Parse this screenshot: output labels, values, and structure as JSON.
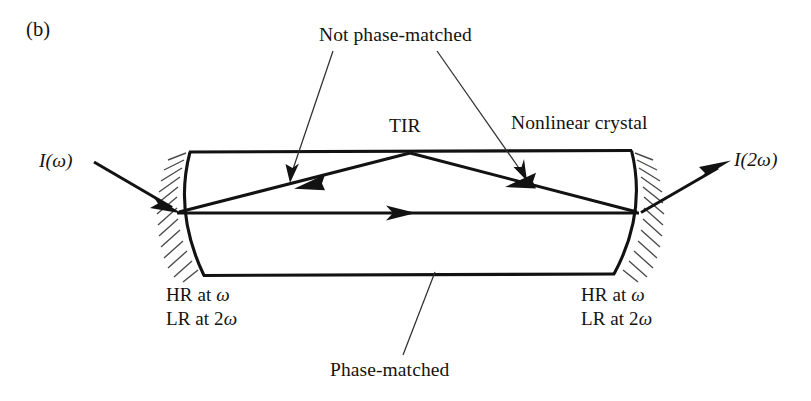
{
  "figure": {
    "panel_letter": "(b)",
    "domain": "Diagram"
  },
  "labels": {
    "not_phase_matched": "Not phase-matched",
    "tir": "TIR",
    "nonlinear_crystal": "Nonlinear crystal",
    "input_beam": "I(ω)",
    "input_beam_prefix": "I(",
    "input_beam_symbol": "ω",
    "input_beam_suffix": ")",
    "output_beam": "I(2ω)",
    "output_beam_prefix": "I(2",
    "output_beam_symbol": "ω",
    "output_beam_suffix": ")",
    "phase_matched": "Phase-matched",
    "coating_hr_prefix": "HR at ",
    "coating_hr_symbol": "ω",
    "coating_lr_prefix": "LR at 2",
    "coating_lr_symbol": "ω",
    "coating_left_line1": "HR at ω",
    "coating_left_line2": "LR at 2ω",
    "coating_right_line1": "HR at ω",
    "coating_right_line2": "LR at 2ω"
  },
  "colors": {
    "ink": "#121212",
    "background": "#ffffff",
    "leader": "#30302e",
    "hatch": "#4a4a48"
  },
  "geometry": {
    "canvas": {
      "width": 811,
      "height": 401
    },
    "crystal": {
      "top_edge": {
        "x1": 190,
        "y1": 152,
        "x2": 631,
        "y2": 151
      },
      "bottom_edge": {
        "x1": 204,
        "y1": 275,
        "x2": 614,
        "y2": 274
      },
      "left_mirror_arc": {
        "top_x": 190,
        "top_y": 152,
        "mid_x": 176,
        "mid_y": 213,
        "bottom_x": 204,
        "bottom_y": 275
      },
      "right_mirror_arc": {
        "top_x": 631,
        "top_y": 151,
        "mid_x": 645,
        "mid_y": 213,
        "bottom_x": 614,
        "bottom_y": 274
      }
    },
    "beams": {
      "axis_beam": {
        "x1": 178,
        "y1": 213,
        "x2": 638,
        "y2": 213,
        "arrow_at_x": 412
      },
      "tir_apex": {
        "x": 410,
        "y": 153
      },
      "input_arrow": {
        "x1": 95,
        "y1": 163,
        "x2": 180,
        "y2": 212
      },
      "output_arrow": {
        "x1": 640,
        "y1": 212,
        "x2": 728,
        "y2": 162
      }
    },
    "leaders": {
      "not_pm_left": {
        "x1": 334,
        "y1": 50,
        "x2": 293,
        "y2": 180
      },
      "not_pm_right": {
        "x1": 437,
        "y1": 50,
        "x2": 523,
        "y2": 180
      },
      "phase_matched": {
        "x1": 404,
        "y1": 356,
        "x2": 434,
        "y2": 277
      }
    }
  }
}
